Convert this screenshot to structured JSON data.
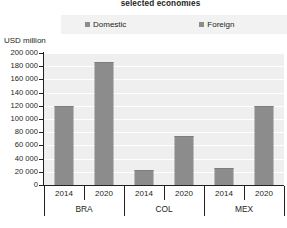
{
  "chart": {
    "title": "selected economies",
    "unit_label": "USD million"
  },
  "legend": {
    "items": [
      {
        "label": "Domestic",
        "color": "#8c8c8c",
        "marker": "square-marker"
      },
      {
        "label": "Foreign",
        "color": "#8c8c8c",
        "marker": "square-marker"
      }
    ]
  },
  "y_axis": {
    "ticks": [
      "200 000",
      "180 000",
      "160 000",
      "140 000",
      "120 000",
      "100 000",
      "80 000",
      "60 000",
      "40 000",
      "20 000",
      "0"
    ]
  },
  "x_axis": {
    "years": [
      "2014",
      "2020",
      "2014",
      "2020",
      "2014",
      "2020"
    ],
    "groups": [
      "BRA",
      "COL",
      "MEX"
    ]
  },
  "chart_data": {
    "type": "bar",
    "title": "selected economies",
    "xlabel": "",
    "ylabel": "USD million",
    "ylim": [
      0,
      200000
    ],
    "ytick_step": 20000,
    "grid": true,
    "legend_position": "top-center",
    "categories": [
      "BRA 2014",
      "BRA 2020",
      "COL 2014",
      "COL 2020",
      "MEX 2014",
      "MEX 2020"
    ],
    "groups": [
      {
        "economy": "BRA",
        "year": "2014",
        "value": 120000
      },
      {
        "economy": "BRA",
        "year": "2020",
        "value": 186000
      },
      {
        "economy": "COL",
        "year": "2014",
        "value": 23000
      },
      {
        "economy": "COL",
        "year": "2020",
        "value": 74000
      },
      {
        "economy": "MEX",
        "year": "2014",
        "value": 26000
      },
      {
        "economy": "MEX",
        "year": "2020",
        "value": 119000
      }
    ],
    "series": [
      {
        "name": "Domestic",
        "values": [
          120000,
          186000,
          23000,
          74000,
          26000,
          119000
        ],
        "color": "#8c8c8c"
      }
    ],
    "values": [
      120000,
      186000,
      23000,
      74000,
      26000,
      119000
    ],
    "bar_color": "#8c8c8c",
    "plot_background": "#efefef"
  }
}
